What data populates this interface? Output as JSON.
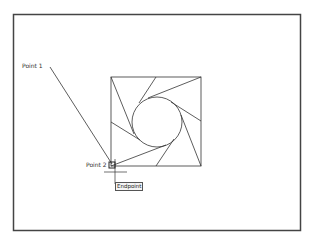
{
  "viewport": {
    "frame": {
      "x": 13,
      "y": 14,
      "w": 288,
      "h": 217,
      "stroke": "#444444"
    },
    "drawing": {
      "square": {
        "x": 111,
        "y": 77,
        "size": 90
      },
      "circle": {
        "cx": 157,
        "cy": 122,
        "r": 25
      },
      "stroke": "#333333"
    },
    "leader": {
      "from": {
        "x": 50,
        "y": 67
      },
      "to": {
        "x": 112,
        "y": 164
      }
    },
    "labels": {
      "point1": "Point 1",
      "point2": "Point 2"
    },
    "snap": {
      "tooltip": "Endpoint",
      "marker": "square-endpoint-marker"
    }
  }
}
